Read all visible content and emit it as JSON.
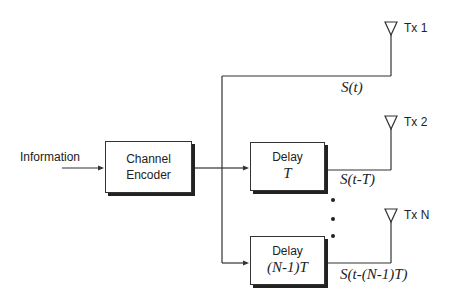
{
  "input_label": "Information",
  "encoder": {
    "line1": "Channel",
    "line2": "Encoder"
  },
  "branches": [
    {
      "antenna": "Tx 1",
      "signal": "S(t)"
    },
    {
      "delay_label": "Delay",
      "delay_value": "T",
      "antenna": "Tx 2",
      "signal": "S(t-T)"
    },
    {
      "delay_label": "Delay",
      "delay_value": "(N-1)T",
      "antenna": "Tx N",
      "signal": "S(t-(N-1)T)"
    }
  ]
}
